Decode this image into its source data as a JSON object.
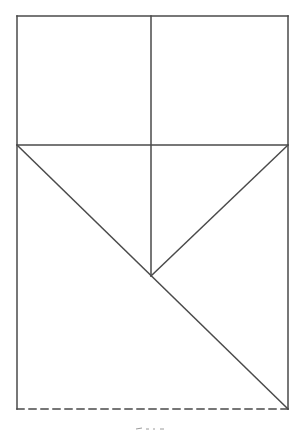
{
  "diagram": {
    "type": "geometric-line-drawing",
    "stroke_color": "#4a4a4a",
    "background": "#ffffff",
    "canvas": {
      "width": 299,
      "height": 431
    },
    "outer_rect": {
      "x1": 17,
      "y1": 16,
      "x2": 288,
      "y2": 409
    },
    "lines": [
      {
        "id": "top-edge",
        "x1": 17,
        "y1": 16,
        "x2": 288,
        "y2": 16,
        "style": "solid"
      },
      {
        "id": "left-edge",
        "x1": 17,
        "y1": 16,
        "x2": 17,
        "y2": 409,
        "style": "solid"
      },
      {
        "id": "right-edge",
        "x1": 288,
        "y1": 16,
        "x2": 288,
        "y2": 409,
        "style": "solid"
      },
      {
        "id": "bottom-edge",
        "x1": 17,
        "y1": 409,
        "x2": 288,
        "y2": 409,
        "style": "dashed"
      },
      {
        "id": "horizontal-middle",
        "x1": 17,
        "y1": 145,
        "x2": 288,
        "y2": 145,
        "style": "solid"
      },
      {
        "id": "vertical-center",
        "x1": 151,
        "y1": 16,
        "x2": 151,
        "y2": 276,
        "style": "solid"
      },
      {
        "id": "diagonal-long",
        "x1": 17,
        "y1": 145,
        "x2": 288,
        "y2": 409,
        "style": "solid"
      },
      {
        "id": "diagonal-short",
        "x1": 288,
        "y1": 145,
        "x2": 151,
        "y2": 276,
        "style": "solid"
      }
    ],
    "caption_fragment": {
      "x": 150,
      "y": 428,
      "visible": true
    }
  }
}
